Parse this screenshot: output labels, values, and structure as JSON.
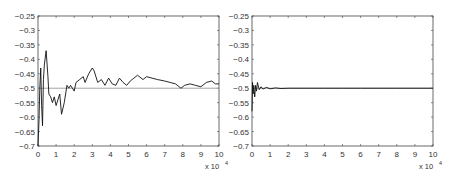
{
  "chart_data": [
    {
      "type": "line",
      "title": "",
      "xlabel": "",
      "ylabel": "",
      "x_multiplier_label": "x 10",
      "x_multiplier_exponent": "4",
      "xlim": [
        0,
        10
      ],
      "ylim": [
        -0.7,
        -0.25
      ],
      "grid": false,
      "xticks": [
        "0",
        "1",
        "2",
        "3",
        "4",
        "5",
        "6",
        "7",
        "8",
        "9",
        "10"
      ],
      "yticks": [
        "-0.25",
        "-0.3",
        "-0.35",
        "-0.4",
        "-0.45",
        "-0.5",
        "-0.55",
        "-0.6",
        "-0.65",
        "-0.7"
      ],
      "reference_line": {
        "y": -0.5,
        "color": "#999999"
      },
      "series": [
        {
          "name": "estimate",
          "color": "#111111",
          "x": [
            0,
            0.05,
            0.1,
            0.15,
            0.2,
            0.25,
            0.3,
            0.35,
            0.45,
            0.55,
            0.6,
            0.7,
            0.8,
            0.9,
            1.0,
            1.1,
            1.2,
            1.3,
            1.45,
            1.6,
            1.7,
            1.8,
            1.9,
            2.0,
            2.1,
            2.3,
            2.5,
            2.6,
            2.8,
            3.0,
            3.1,
            3.3,
            3.5,
            3.7,
            3.9,
            4.1,
            4.3,
            4.5,
            4.7,
            4.9,
            5.1,
            5.3,
            5.5,
            5.8,
            6.0,
            6.3,
            6.6,
            7.0,
            7.3,
            7.6,
            7.9,
            8.1,
            8.4,
            8.7,
            9.0,
            9.3,
            9.6,
            9.8,
            10.0
          ],
          "y": [
            -0.7,
            -0.62,
            -0.5,
            -0.43,
            -0.56,
            -0.63,
            -0.47,
            -0.42,
            -0.37,
            -0.46,
            -0.52,
            -0.53,
            -0.55,
            -0.53,
            -0.56,
            -0.54,
            -0.52,
            -0.59,
            -0.55,
            -0.49,
            -0.5,
            -0.49,
            -0.5,
            -0.51,
            -0.48,
            -0.47,
            -0.46,
            -0.48,
            -0.45,
            -0.43,
            -0.44,
            -0.48,
            -0.47,
            -0.49,
            -0.465,
            -0.485,
            -0.49,
            -0.465,
            -0.48,
            -0.49,
            -0.475,
            -0.465,
            -0.455,
            -0.47,
            -0.46,
            -0.465,
            -0.47,
            -0.475,
            -0.48,
            -0.485,
            -0.5,
            -0.49,
            -0.485,
            -0.49,
            -0.495,
            -0.48,
            -0.475,
            -0.485,
            -0.485
          ]
        }
      ]
    },
    {
      "type": "line",
      "title": "",
      "xlabel": "",
      "ylabel": "",
      "x_multiplier_label": "x 10",
      "x_multiplier_exponent": "4",
      "xlim": [
        0,
        10
      ],
      "ylim": [
        -0.7,
        -0.25
      ],
      "grid": false,
      "xticks": [
        "0",
        "1",
        "2",
        "3",
        "4",
        "5",
        "6",
        "7",
        "8",
        "9",
        "10"
      ],
      "yticks": [
        "-0.25",
        "-0.3",
        "-0.35",
        "-0.4",
        "-0.45",
        "-0.5",
        "-0.55",
        "-0.6",
        "-0.65",
        "-0.7"
      ],
      "reference_line": {
        "y": -0.5,
        "color": "#999999"
      },
      "series": [
        {
          "name": "estimate",
          "color": "#111111",
          "x": [
            0,
            0.03,
            0.06,
            0.1,
            0.15,
            0.2,
            0.25,
            0.3,
            0.4,
            0.5,
            0.6,
            0.8,
            1.0,
            1.3,
            1.6,
            2.0,
            3.0,
            4.0,
            5.0,
            6.0,
            7.0,
            8.0,
            9.0,
            10.0
          ],
          "y": [
            -0.58,
            -0.48,
            -0.52,
            -0.49,
            -0.53,
            -0.49,
            -0.51,
            -0.48,
            -0.505,
            -0.495,
            -0.503,
            -0.497,
            -0.502,
            -0.499,
            -0.501,
            -0.5,
            -0.5,
            -0.5,
            -0.5,
            -0.5,
            -0.5,
            -0.5,
            -0.5,
            -0.5
          ]
        }
      ]
    }
  ]
}
